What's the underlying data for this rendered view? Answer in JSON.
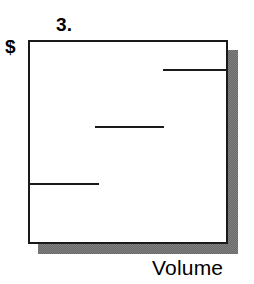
{
  "figure": {
    "title": "3.",
    "y_axis_label": "$",
    "x_axis_label": "Volume"
  },
  "colors": {
    "ink": "#1a1a1a",
    "shadow": "#808080",
    "plot_background": "#ffffff",
    "page_background": "#ffffff"
  },
  "chart_data": {
    "type": "line",
    "title": "3.",
    "subtitle": "",
    "xlabel": "Volume",
    "ylabel": "$",
    "grid": false,
    "legend": null,
    "axis_ticks": {
      "x": [],
      "y": []
    },
    "xlim": [
      0,
      100
    ],
    "ylim": [
      0,
      100
    ],
    "series": [
      {
        "name": "price-step",
        "style": "horizontal-segments",
        "segments": [
          {
            "label": "low-volume step",
            "x_start": 0,
            "x_end": 35,
            "y": 29
          },
          {
            "label": "medium-volume step",
            "x_start": 33,
            "x_end": 69,
            "y": 58
          },
          {
            "label": "high-volume step",
            "x_start": 68,
            "x_end": 100,
            "y": 86
          }
        ]
      }
    ],
    "annotations": []
  },
  "marks": [
    {
      "name": "data-segment-top",
      "left_pct": 68.0,
      "width_pct": 32.0,
      "top_pct": 13.7
    },
    {
      "name": "data-segment-middle",
      "left_pct": 33.0,
      "width_pct": 35.5,
      "top_pct": 42.2
    },
    {
      "name": "data-segment-bottom",
      "left_pct": 0.0,
      "width_pct": 35.0,
      "top_pct": 70.6
    }
  ]
}
